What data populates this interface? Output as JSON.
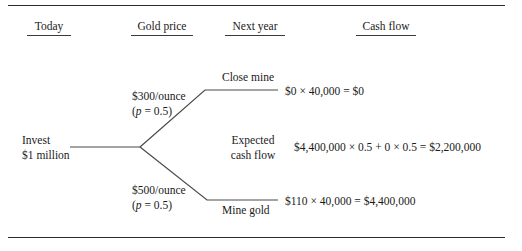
{
  "figure": {
    "title_present": false,
    "background": "#ffffff",
    "line_color": "#4a4a4a",
    "rule_color": "#2b2b2b"
  },
  "headers": [
    {
      "label": "Today"
    },
    {
      "label": "Gold price"
    },
    {
      "label": "Next year"
    },
    {
      "label": "Cash flow"
    }
  ],
  "root": {
    "line1": "Invest",
    "line2": "$1 million"
  },
  "branches": {
    "upper": {
      "price_line1": "$300/ounce",
      "prob_open": "(",
      "prob_var": "p",
      "prob_rest": " = 0.5)",
      "decision": "Close mine",
      "cash_flow": "$0 × 40,000 = $0"
    },
    "lower": {
      "price_line1": "$500/ounce",
      "prob_open": "(",
      "prob_var": "p",
      "prob_rest": " = 0.5)",
      "decision": "Mine gold",
      "cash_flow": "$110 × 40,000 = $4,400,000"
    }
  },
  "expected": {
    "label_line1": "Expected",
    "label_line2": "cash flow",
    "equation": "$4,400,000 × 0.5 + 0 × 0.5 = $2,200,000"
  }
}
